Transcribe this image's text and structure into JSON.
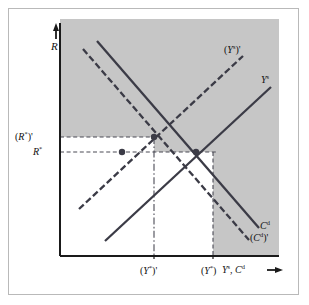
{
  "figure": {
    "kind": "economics-diagram",
    "colors": {
      "shaded_region": "#c6c6c6",
      "plot_background": "#ffffff",
      "axis": "#1a1a1a",
      "curve": "#3b3b46",
      "guide_line": "#4a4a55",
      "marker": "#3b3b46",
      "frame_border": "#b9b9b9"
    }
  },
  "axes": {
    "y_axis_label": "R",
    "y_axis_arrow": "up-arrow",
    "x_axis_label_parts": [
      "Y",
      "s",
      ", ",
      "C",
      "d"
    ],
    "x_axis_label_plain": "Y s, C d",
    "x_axis_arrow": "right-arrow"
  },
  "y_ticks": [
    {
      "id": "r-star-prime",
      "label_plain": "(R*)'",
      "base": "R",
      "star": "*",
      "paren": true,
      "prime": true
    },
    {
      "id": "r-star",
      "label_plain": "R*",
      "base": "R",
      "star": "*",
      "paren": false,
      "prime": false
    }
  ],
  "x_ticks": [
    {
      "id": "y-star-prime",
      "label_plain": "(Y*)'",
      "base": "Y",
      "star": "*",
      "prime": true
    },
    {
      "id": "y-star",
      "label_plain": "(Y*)",
      "base": "Y",
      "star": "*",
      "prime": false
    }
  ],
  "curves": [
    {
      "id": "ys-prime",
      "label_plain": "(Y s)'",
      "style": "dashed",
      "slope": "upward",
      "note": "shifted output supply curve"
    },
    {
      "id": "ys",
      "label_plain": "Y s",
      "style": "solid",
      "slope": "upward",
      "note": "original output supply curve"
    },
    {
      "id": "cd",
      "label_plain": "C d",
      "style": "solid",
      "slope": "downward",
      "note": "original consumption demand curve"
    },
    {
      "id": "cd-prime",
      "label_plain": "(C d)'",
      "style": "dashed",
      "slope": "downward",
      "note": "shifted consumption demand curve"
    }
  ],
  "markers": [
    {
      "id": "equilibrium-new",
      "at": "(Y*)' , (R*)'",
      "shape": "dot"
    },
    {
      "id": "point-mid-left",
      "at": "(Y*)-left , R*",
      "shape": "dot"
    },
    {
      "id": "equilibrium-old",
      "at": "(Y*) , R*",
      "shape": "dot"
    }
  ],
  "guides": [
    {
      "id": "guide-h-r-star-prime",
      "orientation": "horizontal",
      "style": "dashed"
    },
    {
      "id": "guide-h-r-star",
      "orientation": "horizontal",
      "style": "dashed"
    },
    {
      "id": "guide-v-y-star-prime",
      "orientation": "vertical",
      "style": "dash-dot"
    },
    {
      "id": "guide-v-y-star",
      "orientation": "vertical",
      "style": "dashed"
    }
  ]
}
